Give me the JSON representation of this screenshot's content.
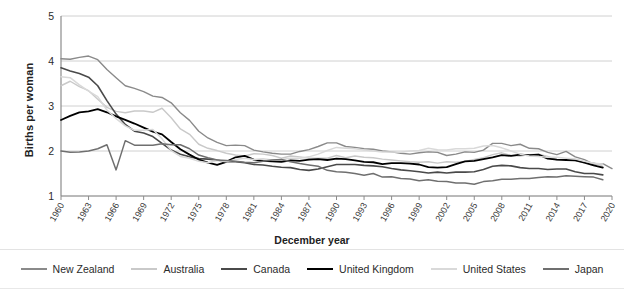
{
  "chart_data": {
    "type": "line",
    "title": "",
    "xlabel": "December year",
    "ylabel": "Births per woman",
    "ylim": [
      1,
      5
    ],
    "yticks": [
      1,
      2,
      3,
      4,
      5
    ],
    "xlim": [
      1960,
      2020
    ],
    "xticks": [
      1960,
      1963,
      1966,
      1969,
      1972,
      1975,
      1978,
      1981,
      1984,
      1987,
      1990,
      1993,
      1996,
      1999,
      2002,
      2005,
      2008,
      2011,
      2014,
      2017,
      2020
    ],
    "grid": "horizontal",
    "legend_position": "bottom",
    "x": [
      1960,
      1961,
      1962,
      1963,
      1964,
      1965,
      1966,
      1967,
      1968,
      1969,
      1970,
      1971,
      1972,
      1973,
      1974,
      1975,
      1976,
      1977,
      1978,
      1979,
      1980,
      1981,
      1982,
      1983,
      1984,
      1985,
      1986,
      1987,
      1988,
      1989,
      1990,
      1991,
      1992,
      1993,
      1994,
      1995,
      1996,
      1997,
      1998,
      1999,
      2000,
      2001,
      2002,
      2003,
      2004,
      2005,
      2006,
      2007,
      2008,
      2009,
      2010,
      2011,
      2012,
      2013,
      2014,
      2015,
      2016,
      2017,
      2018,
      2019,
      2020
    ],
    "series": [
      {
        "name": "New Zealand",
        "color": "#8a8a8a",
        "width": 1.4,
        "values": [
          4.05,
          4.04,
          4.08,
          4.11,
          4.03,
          3.81,
          3.63,
          3.45,
          3.39,
          3.32,
          3.22,
          3.19,
          3.07,
          2.85,
          2.68,
          2.44,
          2.29,
          2.19,
          2.12,
          2.13,
          2.12,
          2.02,
          1.98,
          1.95,
          1.93,
          1.93,
          1.99,
          2.03,
          2.1,
          2.18,
          2.18,
          2.1,
          2.08,
          2.05,
          2.04,
          2.0,
          1.98,
          1.95,
          1.93,
          1.96,
          1.98,
          1.97,
          1.9,
          1.93,
          1.98,
          1.97,
          2.02,
          2.17,
          2.17,
          2.12,
          2.15,
          2.06,
          2.05,
          1.97,
          1.92,
          1.99,
          1.87,
          1.81,
          1.71,
          1.72,
          1.61
        ]
      },
      {
        "name": "Australia",
        "color": "#c9c9c9",
        "width": 1.4,
        "values": [
          3.45,
          3.55,
          3.43,
          3.34,
          3.15,
          2.97,
          2.88,
          2.85,
          2.89,
          2.89,
          2.86,
          2.95,
          2.74,
          2.49,
          2.37,
          2.15,
          2.06,
          2.01,
          1.95,
          1.91,
          1.89,
          1.94,
          1.93,
          1.9,
          1.84,
          1.89,
          1.87,
          1.84,
          1.84,
          1.84,
          1.9,
          1.85,
          1.89,
          1.86,
          1.85,
          1.82,
          1.8,
          1.78,
          1.76,
          1.75,
          1.76,
          1.73,
          1.76,
          1.75,
          1.77,
          1.81,
          1.85,
          1.92,
          1.96,
          1.9,
          1.89,
          1.92,
          1.93,
          1.88,
          1.8,
          1.81,
          1.79,
          1.74,
          1.74,
          1.66,
          1.58
        ]
      },
      {
        "name": "Canada",
        "color": "#4a4a4a",
        "width": 1.6,
        "values": [
          3.85,
          3.78,
          3.72,
          3.64,
          3.45,
          3.12,
          2.82,
          2.59,
          2.44,
          2.4,
          2.32,
          2.17,
          2.02,
          1.93,
          1.87,
          1.83,
          1.82,
          1.8,
          1.76,
          1.76,
          1.74,
          1.7,
          1.69,
          1.66,
          1.64,
          1.63,
          1.59,
          1.57,
          1.6,
          1.65,
          1.7,
          1.7,
          1.7,
          1.68,
          1.67,
          1.65,
          1.61,
          1.58,
          1.56,
          1.54,
          1.51,
          1.53,
          1.51,
          1.53,
          1.53,
          1.54,
          1.59,
          1.66,
          1.68,
          1.67,
          1.63,
          1.61,
          1.61,
          1.59,
          1.6,
          1.6,
          1.54,
          1.5,
          1.5,
          1.47,
          1.4
        ]
      },
      {
        "name": "United Kingdom",
        "color": "#000000",
        "width": 1.8,
        "values": [
          2.69,
          2.78,
          2.86,
          2.88,
          2.93,
          2.86,
          2.77,
          2.69,
          2.61,
          2.52,
          2.43,
          2.37,
          2.2,
          2.04,
          1.92,
          1.81,
          1.74,
          1.69,
          1.76,
          1.86,
          1.89,
          1.81,
          1.78,
          1.77,
          1.76,
          1.79,
          1.78,
          1.81,
          1.82,
          1.8,
          1.83,
          1.82,
          1.79,
          1.76,
          1.75,
          1.71,
          1.73,
          1.73,
          1.72,
          1.7,
          1.64,
          1.63,
          1.64,
          1.71,
          1.77,
          1.78,
          1.82,
          1.86,
          1.91,
          1.89,
          1.92,
          1.91,
          1.92,
          1.83,
          1.81,
          1.8,
          1.79,
          1.74,
          1.68,
          1.63,
          1.58
        ]
      },
      {
        "name": "United States",
        "color": "#d9d9d9",
        "width": 1.5,
        "values": [
          3.65,
          3.63,
          3.47,
          3.33,
          3.21,
          2.91,
          2.72,
          2.56,
          2.46,
          2.46,
          2.48,
          2.27,
          2.01,
          1.88,
          1.84,
          1.77,
          1.74,
          1.79,
          1.76,
          1.81,
          1.84,
          1.81,
          1.83,
          1.8,
          1.81,
          1.84,
          1.84,
          1.87,
          1.93,
          2.01,
          2.08,
          2.06,
          2.05,
          2.02,
          2.0,
          1.98,
          1.98,
          1.97,
          2.0,
          2.01,
          2.06,
          2.03,
          2.02,
          2.05,
          2.05,
          2.06,
          2.11,
          2.12,
          2.07,
          2.0,
          1.93,
          1.89,
          1.88,
          1.86,
          1.86,
          1.84,
          1.82,
          1.77,
          1.73,
          1.71,
          1.64
        ]
      },
      {
        "name": "Japan",
        "color": "#6f6f6f",
        "width": 1.5,
        "values": [
          2.0,
          1.97,
          1.98,
          2.0,
          2.05,
          2.14,
          1.58,
          2.23,
          2.13,
          2.13,
          2.13,
          2.16,
          2.14,
          2.14,
          2.05,
          1.91,
          1.85,
          1.8,
          1.79,
          1.77,
          1.75,
          1.74,
          1.77,
          1.8,
          1.81,
          1.76,
          1.72,
          1.69,
          1.66,
          1.57,
          1.54,
          1.53,
          1.5,
          1.46,
          1.5,
          1.42,
          1.43,
          1.39,
          1.38,
          1.34,
          1.36,
          1.33,
          1.32,
          1.29,
          1.29,
          1.26,
          1.32,
          1.34,
          1.37,
          1.37,
          1.39,
          1.39,
          1.41,
          1.43,
          1.42,
          1.45,
          1.44,
          1.43,
          1.42,
          1.36,
          1.33
        ]
      }
    ],
    "series_end_years": {
      "New Zealand": 2020,
      "Australia": 2019,
      "Canada": 2019,
      "United Kingdom": 2019,
      "United States": 2019,
      "Japan": 2019
    }
  },
  "axis": {
    "y_title": "Births per woman",
    "x_title": "December year"
  }
}
